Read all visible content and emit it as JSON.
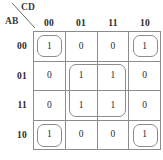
{
  "diagram": {
    "type": "karnaugh-map",
    "variables": {
      "row_label": "AB",
      "column_label": "CD"
    },
    "column_headers": [
      "00",
      "01",
      "11",
      "10"
    ],
    "row_headers": [
      "00",
      "01",
      "11",
      "10"
    ],
    "cells": [
      [
        "1",
        "0",
        "0",
        "1"
      ],
      [
        "0",
        "1",
        "1",
        "0"
      ],
      [
        "0",
        "1",
        "1",
        "0"
      ],
      [
        "1",
        "0",
        "0",
        "1"
      ]
    ],
    "groups": [
      {
        "name": "group-top-left",
        "row": 0,
        "col": 0,
        "row_span": 1,
        "col_span": 1
      },
      {
        "name": "group-top-right",
        "row": 0,
        "col": 3,
        "row_span": 1,
        "col_span": 1
      },
      {
        "name": "group-center",
        "row": 1,
        "col": 1,
        "row_span": 2,
        "col_span": 2
      },
      {
        "name": "group-bottom-left",
        "row": 3,
        "col": 0,
        "row_span": 1,
        "col_span": 1
      },
      {
        "name": "group-bottom-right",
        "row": 3,
        "col": 3,
        "row_span": 1,
        "col_span": 1
      }
    ],
    "colors": {
      "grid_line": "#8c8c8c",
      "group_line": "#8c8c8c",
      "text": "#2b2b2b",
      "background": "#ffffff"
    }
  }
}
